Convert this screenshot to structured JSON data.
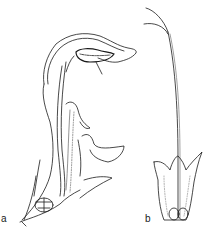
{
  "figure": {
    "panels": [
      {
        "label": "a",
        "subject": "flower-longitudinal-section"
      },
      {
        "label": "b",
        "subject": "calyx-with-pistil"
      }
    ],
    "colors": {
      "ink": "#1a1a1a",
      "background": "#ffffff",
      "stipple": "#9a9a9a"
    }
  }
}
